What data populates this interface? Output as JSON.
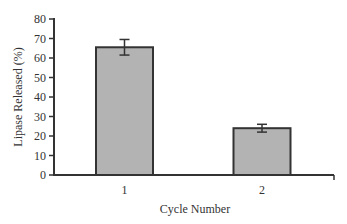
{
  "chart_data": {
    "type": "bar",
    "title": "",
    "xlabel": "Cycle Number",
    "ylabel": "Lipase Released (%)",
    "categories": [
      "1",
      "2"
    ],
    "values": [
      65.5,
      24
    ],
    "error": [
      4,
      2
    ],
    "ylim": [
      0,
      80
    ],
    "yticks": [
      "0",
      "10",
      "20",
      "30",
      "40",
      "50",
      "60",
      "70",
      "80"
    ],
    "grid": false,
    "legend": null,
    "bar_color": "#b3b3b3"
  }
}
